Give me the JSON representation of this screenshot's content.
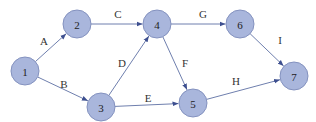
{
  "diagram": {
    "type": "directed-network",
    "nodes": [
      {
        "id": "1",
        "label": "1"
      },
      {
        "id": "2",
        "label": "2"
      },
      {
        "id": "3",
        "label": "3"
      },
      {
        "id": "4",
        "label": "4"
      },
      {
        "id": "5",
        "label": "5"
      },
      {
        "id": "6",
        "label": "6"
      },
      {
        "id": "7",
        "label": "7"
      }
    ],
    "edges": [
      {
        "from": "1",
        "to": "2",
        "label": "A"
      },
      {
        "from": "1",
        "to": "3",
        "label": "B"
      },
      {
        "from": "2",
        "to": "4",
        "label": "C"
      },
      {
        "from": "3",
        "to": "4",
        "label": "D"
      },
      {
        "from": "3",
        "to": "5",
        "label": "E"
      },
      {
        "from": "4",
        "to": "5",
        "label": "F"
      },
      {
        "from": "4",
        "to": "6",
        "label": "G"
      },
      {
        "from": "5",
        "to": "7",
        "label": "H"
      },
      {
        "from": "6",
        "to": "7",
        "label": "I"
      }
    ],
    "colors": {
      "node_fill": "#a9b6dc",
      "node_stroke": "#8492bf",
      "edge": "#6f7fae"
    }
  }
}
